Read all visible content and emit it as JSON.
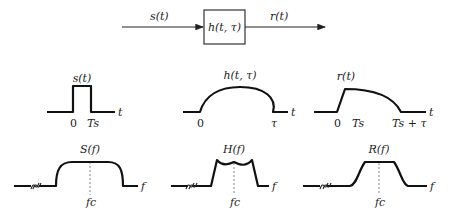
{
  "block_diagram": {
    "input_label": "s(t)",
    "system_label": "h(t, τ)",
    "output_label": "r(t)"
  },
  "time_plots": {
    "input": {
      "title": "s(t)",
      "ticks": [
        "0",
        "Ts"
      ],
      "axis": "t"
    },
    "channel": {
      "title": "h(t, τ)",
      "ticks": [
        "0",
        "τ"
      ],
      "axis": "t"
    },
    "output": {
      "title": "r(t)",
      "ticks": [
        "0",
        "Ts",
        "Ts + τ"
      ],
      "axis": "t"
    }
  },
  "freq_plots": {
    "input": {
      "title": "S(f)",
      "center": "fc",
      "axis": "f"
    },
    "channel": {
      "title": "H(f)",
      "center": "fc",
      "axis": "f"
    },
    "output": {
      "title": "R(f)",
      "center": "fc",
      "axis": "f"
    }
  }
}
